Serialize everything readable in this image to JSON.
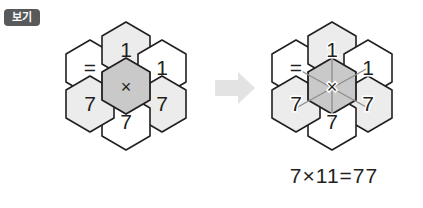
{
  "label_badge": {
    "text": "보기",
    "bg_color": "#58595b",
    "text_color": "#ffffff"
  },
  "colors": {
    "hex_stroke": "#231f20",
    "hex_fill_white": "#ffffff",
    "hex_fill_light": "#ececec",
    "hex_fill_center": "#c9c9c9",
    "arrow_fill": "#e3e3e3",
    "connector_line": "#8d8d8d",
    "text": "#231f20"
  },
  "left_cluster": {
    "name": "example-hex-cluster",
    "center": {
      "symbol": "×",
      "fill": "center"
    },
    "ring": [
      {
        "position": "top",
        "symbol": "1",
        "fill": "light"
      },
      {
        "position": "top-right",
        "symbol": "1",
        "fill": "white"
      },
      {
        "position": "bottom-right",
        "symbol": "7",
        "fill": "light"
      },
      {
        "position": "bottom",
        "symbol": "7",
        "fill": "white"
      },
      {
        "position": "bottom-left",
        "symbol": "7",
        "fill": "light"
      },
      {
        "position": "top-left",
        "symbol": "=",
        "fill": "white"
      }
    ]
  },
  "arrow": {
    "name": "transform-arrow",
    "direction": "right"
  },
  "right_cluster": {
    "name": "solution-hex-cluster",
    "center": {
      "symbol": "×",
      "fill": "center"
    },
    "ring": [
      {
        "position": "top",
        "symbol": "1",
        "fill": "light"
      },
      {
        "position": "top-right",
        "symbol": "1",
        "fill": "white"
      },
      {
        "position": "bottom-right",
        "symbol": "7",
        "fill": "light"
      },
      {
        "position": "bottom",
        "symbol": "7",
        "fill": "white"
      },
      {
        "position": "bottom-left",
        "symbol": "7",
        "fill": "light"
      },
      {
        "position": "top-left",
        "symbol": "=",
        "fill": "white"
      }
    ],
    "connectors_from_center": 6
  },
  "equation": {
    "text": "7×11=77",
    "left": "7",
    "operator": "×",
    "right": "11",
    "equals": "=",
    "result": "77"
  }
}
